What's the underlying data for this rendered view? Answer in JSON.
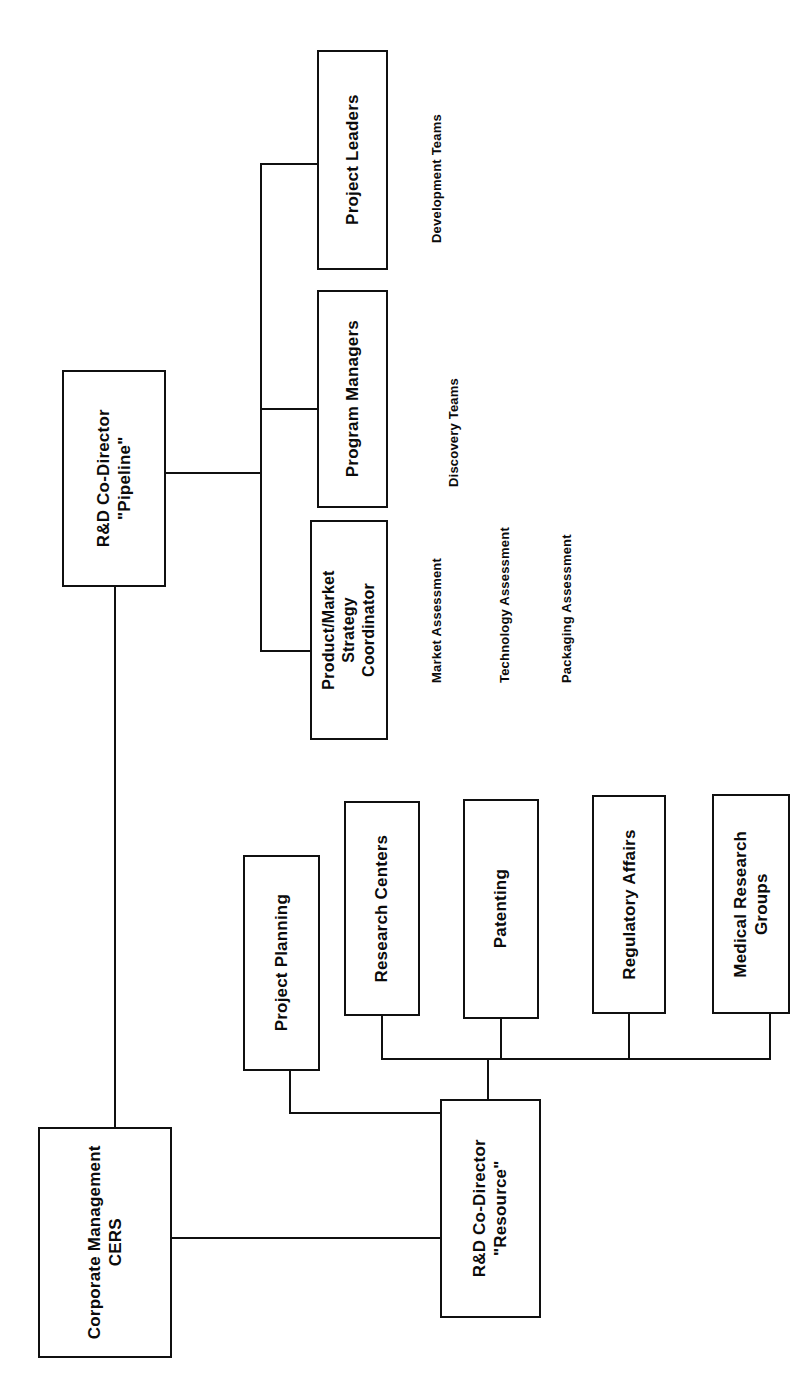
{
  "diagram": {
    "orientation": "rotated-90-ccw",
    "line_color": "#101010",
    "box_fill": "#ffffff",
    "text_color": "#0b0b0b"
  },
  "nodes": {
    "corporate_management": "Corporate Management\nCERS",
    "rd_pipeline": "R&D Co-Director\n\"Pipeline\"",
    "rd_resource": "R&D Co-Director\n\"Resource\"",
    "project_leaders": "Project Leaders",
    "program_managers": "Program Managers",
    "product_market": "Product/Market\nStrategy\nCoordinator",
    "project_planning": "Project Planning",
    "research_centers": "Research Centers",
    "patenting": "Patenting",
    "regulatory_affairs": "Regulatory Affairs",
    "medical_research_groups": "Medical Research\nGroups"
  },
  "annotations": {
    "development_teams": "Development Teams",
    "discovery_teams": "Discovery Teams",
    "market_assessment": "Market Assessment",
    "technology_assessment": "Technology Assessment",
    "packaging_assessment": "Packaging Assessment"
  },
  "chart_data": {
    "type": "table",
    "nodes": [
      {
        "id": "corporate_management",
        "label": "Corporate Management CERS",
        "level": 0
      },
      {
        "id": "rd_pipeline",
        "label": "R&D Co-Director \"Pipeline\"",
        "level": 1
      },
      {
        "id": "rd_resource",
        "label": "R&D Co-Director \"Resource\"",
        "level": 1
      },
      {
        "id": "project_leaders",
        "label": "Project Leaders",
        "level": 2
      },
      {
        "id": "program_managers",
        "label": "Program Managers",
        "level": 2
      },
      {
        "id": "product_market",
        "label": "Product/Market Strategy Coordinator",
        "level": 2
      },
      {
        "id": "project_planning",
        "label": "Project Planning",
        "level": 2
      },
      {
        "id": "research_centers",
        "label": "Research Centers",
        "level": 2
      },
      {
        "id": "patenting",
        "label": "Patenting",
        "level": 2
      },
      {
        "id": "regulatory_affairs",
        "label": "Regulatory Affairs",
        "level": 2
      },
      {
        "id": "medical_research_groups",
        "label": "Medical Research Groups",
        "level": 2
      }
    ],
    "edges": [
      [
        "corporate_management",
        "rd_pipeline"
      ],
      [
        "corporate_management",
        "rd_resource"
      ],
      [
        "rd_pipeline",
        "project_leaders"
      ],
      [
        "rd_pipeline",
        "program_managers"
      ],
      [
        "rd_pipeline",
        "product_market"
      ],
      [
        "rd_resource",
        "project_planning"
      ],
      [
        "rd_resource",
        "research_centers"
      ],
      [
        "rd_resource",
        "patenting"
      ],
      [
        "rd_resource",
        "regulatory_affairs"
      ],
      [
        "rd_resource",
        "medical_research_groups"
      ]
    ],
    "annotations": [
      {
        "near": "project_leaders",
        "text": "Development Teams"
      },
      {
        "near": "program_managers",
        "text": "Discovery Teams"
      },
      {
        "near": "product_market",
        "text": "Market Assessment"
      },
      {
        "near": "product_market",
        "text": "Technology Assessment"
      },
      {
        "near": "product_market",
        "text": "Packaging Assessment"
      }
    ]
  }
}
